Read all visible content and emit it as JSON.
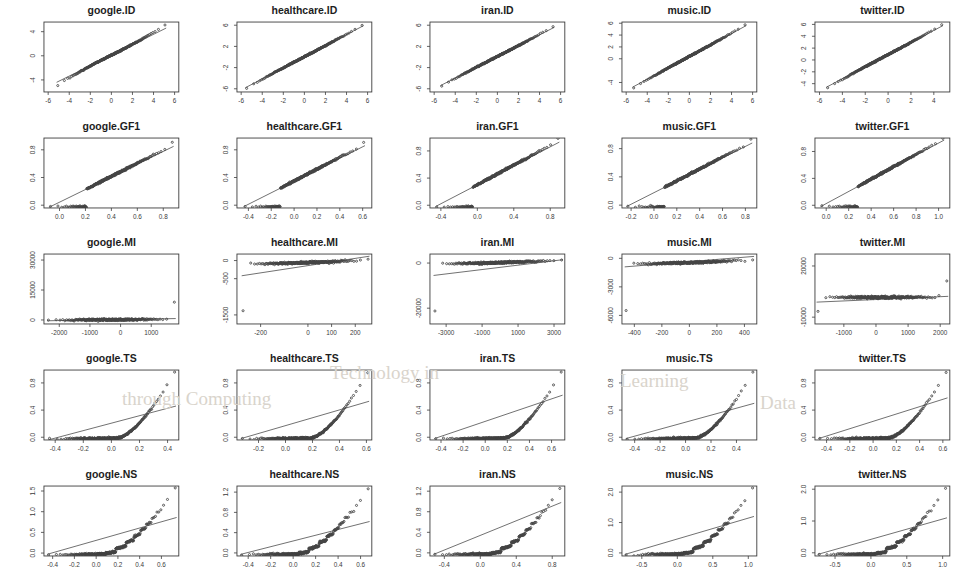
{
  "figure": {
    "type": "qq-plot-grid",
    "rows": 5,
    "cols": 5,
    "datasets": [
      "google",
      "healthcare",
      "iran",
      "music",
      "twitter"
    ],
    "measures": [
      "ID",
      "GF1",
      "MI",
      "TS",
      "NS"
    ],
    "point_color": "#454545",
    "line_color": "#4d4d4d",
    "axis_color": "#3c3c3c",
    "background": "#ffffff"
  },
  "chart_data": [
    {
      "type": "scatter",
      "title": "google.ID",
      "xlabel": "",
      "ylabel": "",
      "xticks": [
        "-6",
        "-4",
        "-2",
        "0",
        "2",
        "4",
        "6"
      ],
      "xtickvals": [
        -6,
        -4,
        -2,
        0,
        2,
        4,
        6
      ],
      "yticks": [
        "-4",
        "0",
        "4"
      ],
      "ytickvals": [
        -4,
        0,
        4
      ],
      "xlim": [
        -6.4,
        6.4
      ],
      "ylim": [
        -6.0,
        5.6
      ],
      "grid": false,
      "legend": null,
      "qqline": [
        [
          -5.2,
          -4.4
        ],
        [
          5.2,
          4.6
        ]
      ],
      "shape": "s-curve-mild"
    },
    {
      "type": "scatter",
      "title": "healthcare.ID",
      "xlabel": "",
      "ylabel": "",
      "xticks": [
        "-6",
        "-4",
        "-2",
        "0",
        "2",
        "4",
        "6"
      ],
      "xtickvals": [
        -6,
        -4,
        -2,
        0,
        2,
        4,
        6
      ],
      "yticks": [
        "-6",
        "-2",
        "2",
        "6"
      ],
      "ytickvals": [
        -6,
        -2,
        2,
        6
      ],
      "xlim": [
        -6.4,
        6.4
      ],
      "ylim": [
        -6.6,
        6.6
      ],
      "grid": false,
      "legend": null,
      "qqline": [
        [
          -5.6,
          -5.8
        ],
        [
          5.6,
          5.9
        ]
      ],
      "shape": "linear"
    },
    {
      "type": "scatter",
      "title": "iran.ID",
      "xlabel": "",
      "ylabel": "",
      "xticks": [
        "-6",
        "-4",
        "-2",
        "0",
        "2",
        "4",
        "6"
      ],
      "xtickvals": [
        -6,
        -4,
        -2,
        0,
        2,
        4,
        6
      ],
      "yticks": [
        "-6",
        "-2",
        "2",
        "6"
      ],
      "ytickvals": [
        -6,
        -2,
        2,
        6
      ],
      "xlim": [
        -6.4,
        6.4
      ],
      "ylim": [
        -6.6,
        6.6
      ],
      "grid": false,
      "legend": null,
      "qqline": [
        [
          -5.4,
          -5.4
        ],
        [
          5.4,
          5.6
        ]
      ],
      "shape": "linear"
    },
    {
      "type": "scatter",
      "title": "music.ID",
      "xlabel": "",
      "ylabel": "",
      "xticks": [
        "-6",
        "-4",
        "-2",
        "0",
        "2",
        "4",
        "6"
      ],
      "xtickvals": [
        -6,
        -4,
        -2,
        0,
        2,
        4,
        6
      ],
      "yticks": [
        "-4",
        "0",
        "2",
        "4",
        "6"
      ],
      "ytickvals": [
        -4,
        0,
        2,
        4,
        6
      ],
      "xlim": [
        -6.4,
        6.4
      ],
      "ylim": [
        -5.6,
        6.2
      ],
      "grid": false,
      "legend": null,
      "qqline": [
        [
          -5.4,
          -4.8
        ],
        [
          5.4,
          5.6
        ]
      ],
      "shape": "linear"
    },
    {
      "type": "scatter",
      "title": "twitter.ID",
      "xlabel": "",
      "ylabel": "",
      "xticks": [
        "-6",
        "-4",
        "-2",
        "0",
        "2",
        "4"
      ],
      "xtickvals": [
        -6,
        -4,
        -2,
        0,
        2,
        4
      ],
      "yticks": [
        "-4",
        "-2",
        "0",
        "2",
        "4",
        "6"
      ],
      "ytickvals": [
        -4,
        -2,
        0,
        2,
        4,
        6
      ],
      "xlim": [
        -6.4,
        5.4
      ],
      "ylim": [
        -5.4,
        6.4
      ],
      "grid": false,
      "legend": null,
      "qqline": [
        [
          -5.4,
          -4.6
        ],
        [
          4.8,
          5.8
        ]
      ],
      "shape": "linear"
    },
    {
      "type": "scatter",
      "title": "google.GF1",
      "xlabel": "",
      "ylabel": "",
      "xticks": [
        "0.0",
        "0.2",
        "0.4",
        "0.6",
        "0.8"
      ],
      "xtickvals": [
        0.0,
        0.2,
        0.4,
        0.6,
        0.8
      ],
      "yticks": [
        "0.0",
        "0.4",
        "0.8"
      ],
      "ytickvals": [
        0.0,
        0.4,
        0.8
      ],
      "xlim": [
        -0.12,
        0.92
      ],
      "ylim": [
        -0.04,
        0.97
      ],
      "grid": false,
      "legend": null,
      "qqline": [
        [
          -0.08,
          -0.03
        ],
        [
          0.88,
          0.85
        ]
      ],
      "shape": "floor-then-linear"
    },
    {
      "type": "scatter",
      "title": "healthcare.GF1",
      "xlabel": "",
      "ylabel": "",
      "xticks": [
        "-0.4",
        "-0.2",
        "0.0",
        "0.2",
        "0.4",
        "0.6"
      ],
      "xtickvals": [
        -0.4,
        -0.2,
        0.0,
        0.2,
        0.4,
        0.6
      ],
      "yticks": [
        "0.0",
        "0.4",
        "0.8"
      ],
      "ytickvals": [
        0.0,
        0.4,
        0.8
      ],
      "xlim": [
        -0.5,
        0.68
      ],
      "ylim": [
        -0.04,
        0.97
      ],
      "grid": false,
      "legend": null,
      "qqline": [
        [
          -0.44,
          -0.02
        ],
        [
          0.62,
          0.86
        ]
      ],
      "shape": "floor-then-linear"
    },
    {
      "type": "scatter",
      "title": "iran.GF1",
      "xlabel": "",
      "ylabel": "",
      "xticks": [
        "-0.4",
        "0.0",
        "0.4",
        "0.8"
      ],
      "xtickvals": [
        -0.4,
        0.0,
        0.4,
        0.8
      ],
      "yticks": [
        "0.0",
        "0.4",
        "0.8"
      ],
      "ytickvals": [
        0.0,
        0.4,
        0.8
      ],
      "xlim": [
        -0.52,
        0.96
      ],
      "ylim": [
        -0.04,
        0.99
      ],
      "grid": false,
      "legend": null,
      "qqline": [
        [
          -0.46,
          -0.02
        ],
        [
          0.9,
          0.93
        ]
      ],
      "shape": "floor-then-linear"
    },
    {
      "type": "scatter",
      "title": "music.GF1",
      "xlabel": "",
      "ylabel": "",
      "xticks": [
        "-0.2",
        "0.0",
        "0.2",
        "0.4",
        "0.6",
        "0.8"
      ],
      "xtickvals": [
        -0.2,
        0.0,
        0.2,
        0.4,
        0.6,
        0.8
      ],
      "yticks": [
        "0.0",
        "0.4",
        "0.8"
      ],
      "ytickvals": [
        0.0,
        0.4,
        0.8
      ],
      "xlim": [
        -0.28,
        0.9
      ],
      "ylim": [
        -0.04,
        0.95
      ],
      "grid": false,
      "legend": null,
      "qqline": [
        [
          -0.24,
          -0.02
        ],
        [
          0.86,
          0.88
        ]
      ],
      "shape": "floor-then-linear"
    },
    {
      "type": "scatter",
      "title": "twitter.GF1",
      "xlabel": "",
      "ylabel": "",
      "xticks": [
        "0.0",
        "0.2",
        "0.4",
        "0.6",
        "0.8",
        "1.0"
      ],
      "xtickvals": [
        0.0,
        0.2,
        0.4,
        0.6,
        0.8,
        1.0
      ],
      "yticks": [
        "0.0",
        "0.4",
        "0.8"
      ],
      "ytickvals": [
        0.0,
        0.4,
        0.8
      ],
      "xlim": [
        -0.1,
        1.1
      ],
      "ylim": [
        -0.04,
        1.0
      ],
      "grid": false,
      "legend": null,
      "qqline": [
        [
          -0.05,
          -0.02
        ],
        [
          1.05,
          0.97
        ]
      ],
      "shape": "floor-then-linear"
    },
    {
      "type": "scatter",
      "title": "google.MI",
      "xlabel": "",
      "ylabel": "",
      "xticks": [
        "-2000",
        "-1000",
        "0",
        "1000"
      ],
      "xtickvals": [
        -2000,
        -1000,
        0,
        1000
      ],
      "yticks": [
        "0",
        "15000",
        "30000"
      ],
      "ytickvals": [
        0,
        15000,
        30000
      ],
      "xlim": [
        -2500,
        1900
      ],
      "ylim": [
        -2000,
        33000
      ],
      "grid": false,
      "legend": null,
      "qqline": [
        [
          -2400,
          -400
        ],
        [
          1800,
          700
        ]
      ],
      "shape": "flat-with-extreme-upper-tail"
    },
    {
      "type": "scatter",
      "title": "healthcare.MI",
      "xlabel": "",
      "ylabel": "",
      "xticks": [
        "-200",
        "0",
        "100",
        "200"
      ],
      "xtickvals": [
        -200,
        0,
        100,
        200
      ],
      "yticks": [
        "0",
        "-500",
        "-1500"
      ],
      "ytickvals": [
        0,
        -500,
        -1500
      ],
      "xlim": [
        -300,
        270
      ],
      "ylim": [
        -1750,
        180
      ],
      "grid": false,
      "legend": null,
      "qqline": [
        [
          -280,
          -420
        ],
        [
          260,
          120
        ]
      ],
      "shape": "lower-tail-drop"
    },
    {
      "type": "scatter",
      "title": "iran.MI",
      "xlabel": "",
      "ylabel": "",
      "xticks": [
        "-3000",
        "-1000",
        "1000",
        "3000"
      ],
      "xtickvals": [
        -3000,
        -1000,
        1000,
        3000
      ],
      "yticks": [
        "0",
        "-20000"
      ],
      "ytickvals": [
        0,
        -20000
      ],
      "xlim": [
        -3900,
        3600
      ],
      "ylim": [
        -27000,
        4000
      ],
      "grid": false,
      "legend": null,
      "qqline": [
        [
          -3700,
          -5500
        ],
        [
          3500,
          1500
        ]
      ],
      "shape": "lower-tail-drop"
    },
    {
      "type": "scatter",
      "title": "music.MI",
      "xlabel": "",
      "ylabel": "",
      "xticks": [
        "-400",
        "-200",
        "0",
        "200",
        "400"
      ],
      "xtickvals": [
        -400,
        -200,
        0,
        200,
        400
      ],
      "yticks": [
        "0",
        "-3000",
        "-6000"
      ],
      "ytickvals": [
        0,
        -3000,
        -6000
      ],
      "xlim": [
        -490,
        490
      ],
      "ylim": [
        -6900,
        450
      ],
      "grid": false,
      "legend": null,
      "qqline": [
        [
          -470,
          -900
        ],
        [
          470,
          200
        ]
      ],
      "shape": "lower-tail-drop"
    },
    {
      "type": "scatter",
      "title": "twitter.MI",
      "xlabel": "",
      "ylabel": "",
      "xticks": [
        "-1000",
        "0",
        "1000",
        "2000"
      ],
      "xtickvals": [
        -1000,
        0,
        1000,
        2000
      ],
      "yticks": [
        "20000",
        "-10000"
      ],
      "ytickvals": [
        20000,
        -10000
      ],
      "xlim": [
        -1900,
        2300
      ],
      "ylim": [
        -14000,
        27000
      ],
      "grid": false,
      "legend": null,
      "qqline": [
        [
          -1850,
          -1200
        ],
        [
          2250,
          2200
        ]
      ],
      "shape": "flat-both-tails"
    },
    {
      "type": "scatter",
      "title": "google.TS",
      "xlabel": "",
      "ylabel": "",
      "xticks": [
        "-0.4",
        "-0.2",
        "0.0",
        "0.2",
        "0.4"
      ],
      "xtickvals": [
        -0.4,
        -0.2,
        0.0,
        0.2,
        0.4
      ],
      "yticks": [
        "0.0",
        "0.4",
        "0.8"
      ],
      "ytickvals": [
        0.0,
        0.4,
        0.8
      ],
      "xlim": [
        -0.48,
        0.48
      ],
      "ylim": [
        -0.04,
        0.99
      ],
      "grid": false,
      "legend": null,
      "qqline": [
        [
          -0.45,
          -0.04
        ],
        [
          0.46,
          0.46
        ]
      ],
      "shape": "floor-then-steep-rise"
    },
    {
      "type": "scatter",
      "title": "healthcare.TS",
      "xlabel": "",
      "ylabel": "",
      "xticks": [
        "-0.2",
        "0.0",
        "0.2",
        "0.4",
        "0.6"
      ],
      "xtickvals": [
        -0.2,
        0.0,
        0.2,
        0.4,
        0.6
      ],
      "yticks": [
        "0.0",
        "0.4",
        "0.8"
      ],
      "ytickvals": [
        0.0,
        0.4,
        0.8
      ],
      "xlim": [
        -0.36,
        0.64
      ],
      "ylim": [
        -0.04,
        0.99
      ],
      "grid": false,
      "legend": null,
      "qqline": [
        [
          -0.33,
          -0.02
        ],
        [
          0.62,
          0.53
        ]
      ],
      "shape": "floor-then-steep-rise"
    },
    {
      "type": "scatter",
      "title": "iran.TS",
      "xlabel": "",
      "ylabel": "",
      "xticks": [
        "-0.4",
        "-0.2",
        "0.0",
        "0.2",
        "0.4",
        "0.6"
      ],
      "xtickvals": [
        -0.4,
        -0.2,
        0.0,
        0.2,
        0.4,
        0.6
      ],
      "yticks": [
        "0.0",
        "0.4",
        "0.8"
      ],
      "ytickvals": [
        0.0,
        0.4,
        0.8
      ],
      "xlim": [
        -0.5,
        0.72
      ],
      "ylim": [
        -0.04,
        0.99
      ],
      "grid": false,
      "legend": null,
      "qqline": [
        [
          -0.46,
          -0.02
        ],
        [
          0.7,
          0.62
        ]
      ],
      "shape": "floor-then-steep-rise"
    },
    {
      "type": "scatter",
      "title": "music.TS",
      "xlabel": "",
      "ylabel": "",
      "xticks": [
        "-0.4",
        "-0.2",
        "0.0",
        "0.2",
        "0.4"
      ],
      "xtickvals": [
        -0.4,
        -0.2,
        0.0,
        0.2,
        0.4
      ],
      "yticks": [
        "0.0",
        "0.4",
        "0.8"
      ],
      "ytickvals": [
        0.0,
        0.4,
        0.8
      ],
      "xlim": [
        -0.5,
        0.56
      ],
      "ylim": [
        -0.04,
        0.99
      ],
      "grid": false,
      "legend": null,
      "qqline": [
        [
          -0.47,
          -0.02
        ],
        [
          0.54,
          0.5
        ]
      ],
      "shape": "floor-then-steep-rise"
    },
    {
      "type": "scatter",
      "title": "twitter.TS",
      "xlabel": "",
      "ylabel": "",
      "xticks": [
        "-0.4",
        "-0.2",
        "0.0",
        "0.2",
        "0.4",
        "0.6"
      ],
      "xtickvals": [
        -0.4,
        -0.2,
        0.0,
        0.2,
        0.4,
        0.6
      ],
      "yticks": [
        "0.0",
        "0.4",
        "0.8"
      ],
      "ytickvals": [
        0.0,
        0.4,
        0.8
      ],
      "xlim": [
        -0.5,
        0.66
      ],
      "ylim": [
        -0.04,
        0.99
      ],
      "grid": false,
      "legend": null,
      "qqline": [
        [
          -0.47,
          -0.02
        ],
        [
          0.64,
          0.58
        ]
      ],
      "shape": "floor-then-steep-rise"
    },
    {
      "type": "scatter",
      "title": "google.NS",
      "xlabel": "",
      "ylabel": "",
      "xticks": [
        "-0.4",
        "-0.2",
        "0.0",
        "0.2",
        "0.4",
        "0.6"
      ],
      "xtickvals": [
        -0.4,
        -0.2,
        0.0,
        0.2,
        0.4,
        0.6
      ],
      "yticks": [
        "0.0",
        "0.5",
        "1.0",
        "1.5"
      ],
      "ytickvals": [
        0.0,
        0.5,
        1.0,
        1.5
      ],
      "xlim": [
        -0.48,
        0.76
      ],
      "ylim": [
        -0.07,
        1.62
      ],
      "grid": false,
      "legend": null,
      "qqline": [
        [
          -0.45,
          -0.03
        ],
        [
          0.74,
          0.86
        ]
      ],
      "shape": "staircase-rise"
    },
    {
      "type": "scatter",
      "title": "healthcare.NS",
      "xlabel": "",
      "ylabel": "",
      "xticks": [
        "-0.4",
        "-0.2",
        "0.0",
        "0.2",
        "0.4",
        "0.6"
      ],
      "xtickvals": [
        -0.4,
        -0.2,
        0.0,
        0.2,
        0.4,
        0.6
      ],
      "yticks": [
        "0.0",
        "0.4",
        "0.8",
        "1.2"
      ],
      "ytickvals": [
        0.0,
        0.4,
        0.8,
        1.2
      ],
      "xlim": [
        -0.5,
        0.7
      ],
      "ylim": [
        -0.06,
        1.32
      ],
      "grid": false,
      "legend": null,
      "qqline": [
        [
          -0.47,
          -0.03
        ],
        [
          0.68,
          0.62
        ]
      ],
      "shape": "staircase-rise"
    },
    {
      "type": "scatter",
      "title": "iran.NS",
      "xlabel": "",
      "ylabel": "",
      "xticks": [
        "-0.4",
        "0.0",
        "0.4",
        "0.8"
      ],
      "xtickvals": [
        -0.4,
        0.0,
        0.4,
        0.8
      ],
      "yticks": [
        "0.0",
        "0.4",
        "0.8",
        "1.2"
      ],
      "ytickvals": [
        0.0,
        0.4,
        0.8,
        1.2
      ],
      "xlim": [
        -0.56,
        0.94
      ],
      "ylim": [
        -0.06,
        1.3
      ],
      "grid": false,
      "legend": null,
      "qqline": [
        [
          -0.52,
          -0.03
        ],
        [
          0.9,
          0.98
        ]
      ],
      "shape": "staircase-rise"
    },
    {
      "type": "scatter",
      "title": "music.NS",
      "xlabel": "",
      "ylabel": "",
      "xticks": [
        "-0.5",
        "0.0",
        "0.5",
        "1.0"
      ],
      "xtickvals": [
        -0.5,
        0.0,
        0.5,
        1.0
      ],
      "yticks": [
        "0.0",
        "1.0",
        "2.0"
      ],
      "ytickvals": [
        0.0,
        1.0,
        2.0
      ],
      "xlim": [
        -0.78,
        1.12
      ],
      "ylim": [
        -0.1,
        2.2
      ],
      "grid": false,
      "legend": null,
      "qqline": [
        [
          -0.74,
          -0.05
        ],
        [
          1.08,
          1.2
        ]
      ],
      "shape": "staircase-rise"
    },
    {
      "type": "scatter",
      "title": "twitter.NS",
      "xlabel": "",
      "ylabel": "",
      "xticks": [
        "-0.5",
        "0.0",
        "0.5",
        "1.0"
      ],
      "xtickvals": [
        -0.5,
        0.0,
        0.5,
        1.0
      ],
      "yticks": [
        "0.0",
        "1.0",
        "2.0"
      ],
      "ytickvals": [
        0.0,
        1.0,
        2.0
      ],
      "xlim": [
        -0.78,
        1.1
      ],
      "ylim": [
        -0.1,
        2.1
      ],
      "grid": false,
      "legend": null,
      "qqline": [
        [
          -0.74,
          -0.05
        ],
        [
          1.06,
          1.1
        ]
      ],
      "shape": "staircase-rise"
    }
  ],
  "watermark": {
    "lines": [
      {
        "text": "Technology in",
        "x": 330,
        "y": 362
      },
      {
        "text": "through Computing",
        "x": 122,
        "y": 388
      },
      {
        "text": "Learning",
        "x": 620,
        "y": 370
      },
      {
        "text": "Data",
        "x": 760,
        "y": 392
      }
    ]
  }
}
